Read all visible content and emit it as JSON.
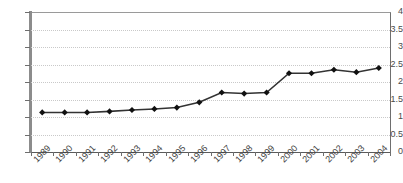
{
  "chart_data": {
    "type": "line",
    "title": "",
    "subtitle": "",
    "xlabel": "",
    "ylabel": "",
    "categories": [
      "1989",
      "1990",
      "1991",
      "1992",
      "1993",
      "1994",
      "1995",
      "1996",
      "1997",
      "1998",
      "1999",
      "2000",
      "2001",
      "2002",
      "2003",
      "2004"
    ],
    "values": [
      1.13,
      1.13,
      1.13,
      1.16,
      1.2,
      1.23,
      1.27,
      1.42,
      1.7,
      1.67,
      1.7,
      2.25,
      2.25,
      2.35,
      2.28,
      2.4
    ],
    "series": [
      {
        "name": "",
        "values": [
          1.13,
          1.13,
          1.13,
          1.16,
          1.2,
          1.23,
          1.27,
          1.42,
          1.7,
          1.67,
          1.7,
          2.25,
          2.25,
          2.35,
          2.28,
          2.4
        ]
      }
    ],
    "ylim": [
      0,
      4
    ],
    "ytick_labels": [
      "0",
      "0.5",
      "1",
      "1.5",
      "2",
      "2.5",
      "3",
      "3.5",
      "4"
    ],
    "ytick_values": [
      0,
      0.5,
      1,
      1.5,
      2,
      2.5,
      3,
      3.5,
      4
    ],
    "grid": true,
    "grid_axis": "y",
    "legend": false,
    "legend_position": "none",
    "marker": "diamond",
    "annotations": [],
    "colors": {
      "line": "#333333",
      "marker": "#111111",
      "gridline": "#c9c9c9",
      "axis": "#6e6e6e",
      "background": "#ffffff",
      "tick_text": "#3f3f3f"
    }
  }
}
